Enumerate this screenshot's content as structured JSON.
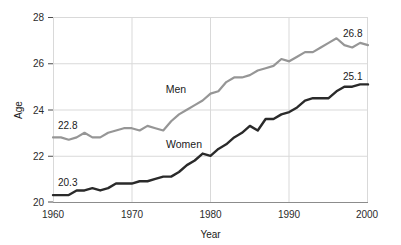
{
  "chart_data": {
    "type": "line",
    "title": "",
    "xlabel": "Year",
    "ylabel": "Age",
    "xlim": [
      1960,
      2000
    ],
    "ylim": [
      20,
      28
    ],
    "grid": true,
    "legend_position": "inline-annotations",
    "xticks": [
      "1960",
      "1970",
      "1980",
      "1990",
      "2000"
    ],
    "xtick_values": [
      1960,
      1970,
      1980,
      1990,
      2000
    ],
    "yticks": [
      "20",
      "22",
      "24",
      "26",
      "28"
    ],
    "ytick_values": [
      20,
      22,
      24,
      26,
      28
    ],
    "x": [
      1960,
      1961,
      1962,
      1963,
      1964,
      1965,
      1966,
      1967,
      1968,
      1969,
      1970,
      1971,
      1972,
      1973,
      1974,
      1975,
      1976,
      1977,
      1978,
      1979,
      1980,
      1981,
      1982,
      1983,
      1984,
      1985,
      1986,
      1987,
      1988,
      1989,
      1990,
      1991,
      1992,
      1993,
      1994,
      1995,
      1996,
      1997,
      1998,
      1999,
      2000
    ],
    "series": [
      {
        "name": "Men",
        "color": "#969696",
        "label_start": "22.8",
        "label_end": "26.8",
        "values": [
          22.8,
          22.8,
          22.7,
          22.8,
          23.0,
          22.8,
          22.8,
          23.0,
          23.1,
          23.2,
          23.2,
          23.1,
          23.3,
          23.2,
          23.1,
          23.5,
          23.8,
          24.0,
          24.2,
          24.4,
          24.7,
          24.8,
          25.2,
          25.4,
          25.4,
          25.5,
          25.7,
          25.8,
          25.9,
          26.2,
          26.1,
          26.3,
          26.5,
          26.5,
          26.7,
          26.9,
          27.1,
          26.8,
          26.7,
          26.9,
          26.8
        ]
      },
      {
        "name": "Women",
        "color": "#2a2a2a",
        "label_start": "20.3",
        "label_end": "25.1",
        "values": [
          20.3,
          20.3,
          20.3,
          20.5,
          20.5,
          20.6,
          20.5,
          20.6,
          20.8,
          20.8,
          20.8,
          20.9,
          20.9,
          21.0,
          21.1,
          21.1,
          21.3,
          21.6,
          21.8,
          22.1,
          22.0,
          22.3,
          22.5,
          22.8,
          23.0,
          23.3,
          23.1,
          23.6,
          23.6,
          23.8,
          23.9,
          24.1,
          24.4,
          24.5,
          24.5,
          24.5,
          24.8,
          25.0,
          25.0,
          25.1,
          25.1
        ]
      }
    ],
    "annotations": [
      {
        "text": "Men",
        "series": "Men"
      },
      {
        "text": "Women",
        "series": "Women"
      },
      {
        "text": "22.8",
        "series": "Men",
        "position": "start"
      },
      {
        "text": "26.8",
        "series": "Men",
        "position": "end"
      },
      {
        "text": "20.3",
        "series": "Women",
        "position": "start"
      },
      {
        "text": "25.1",
        "series": "Women",
        "position": "end"
      }
    ]
  }
}
